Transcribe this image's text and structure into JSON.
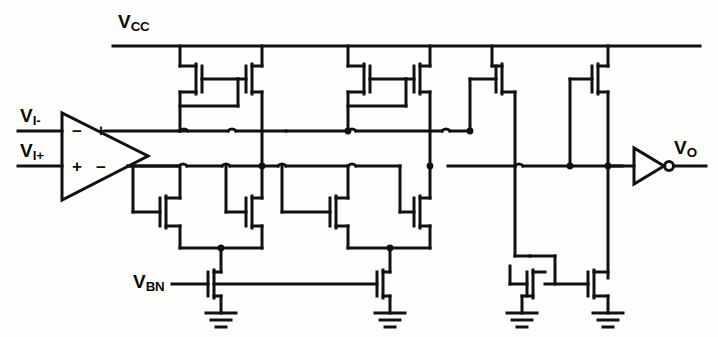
{
  "figure": {
    "kind": "circuit-schematic",
    "line_color": "#111111",
    "background_color": "#fdfdfb"
  },
  "labels": {
    "vcc": {
      "base": "V",
      "sub": "CC",
      "x": 118,
      "y": 10
    },
    "vin_minus": {
      "base": "V",
      "sub": "I-",
      "x": 20,
      "y": 108
    },
    "vin_plus": {
      "base": "V",
      "sub": "I+",
      "x": 20,
      "y": 143
    },
    "vbn": {
      "base": "V",
      "sub": "BN",
      "x": 133,
      "y": 258
    },
    "vout": {
      "base": "V",
      "sub": "O",
      "x": 672,
      "y": 138
    }
  },
  "amplifier_signs": {
    "top_minus": "−",
    "top_plus": "+",
    "bottom_plus": "+",
    "bottom_minus": "−"
  },
  "nets": {
    "supply_rail": "VCC",
    "ground_symbols": 4,
    "bias_net": "VBN",
    "output_net": "VO"
  },
  "devices": {
    "pmos_count": 6,
    "nmos_count": 6,
    "input_amplifier": 1,
    "output_inverter": 1
  }
}
